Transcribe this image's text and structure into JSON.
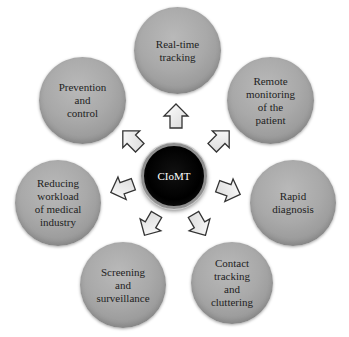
{
  "diagram": {
    "center": {
      "label": "CIoMT",
      "fill": "#000000",
      "text_color": "#ffffff"
    },
    "node_fill": "#a6a6a6",
    "arrow_fill": "#ffffff",
    "arrow_stroke": "#333333",
    "nodes": [
      {
        "id": "real-time-tracking",
        "lines": [
          "Real-time",
          "tracking"
        ]
      },
      {
        "id": "remote-monitoring",
        "lines": [
          "Remote",
          "monitoring",
          "of the",
          "patient"
        ]
      },
      {
        "id": "rapid-diagnosis",
        "lines": [
          "Rapid",
          "diagnosis"
        ]
      },
      {
        "id": "contact-tracking",
        "lines": [
          "Contact",
          "tracking",
          "and",
          "cluttering"
        ]
      },
      {
        "id": "screening-surveillance",
        "lines": [
          "Screening",
          "and",
          "surveillance"
        ]
      },
      {
        "id": "reducing-workload",
        "lines": [
          "Reducing",
          "workload",
          "of medical",
          "industry"
        ]
      },
      {
        "id": "prevention-control",
        "lines": [
          "Prevention",
          "and",
          "control"
        ]
      }
    ],
    "arrow_count": 7
  }
}
